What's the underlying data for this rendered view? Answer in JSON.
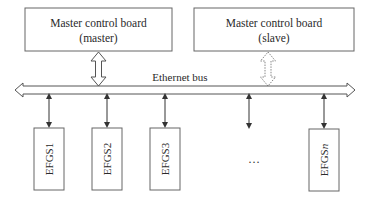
{
  "diagram": {
    "master_board": {
      "line1": "Master control board",
      "line2": "(master)"
    },
    "slave_board": {
      "line1": "Master control board",
      "line2": "(slave)"
    },
    "bus": {
      "label": "Ethernet bus"
    },
    "nodes": [
      {
        "label": "EFGS1"
      },
      {
        "label": "EFGS2"
      },
      {
        "label": "EFGS3"
      },
      {
        "label": "EFGS",
        "subscript_italic": "n"
      }
    ],
    "ellipsis": "…",
    "colors": {
      "stroke": "#555555",
      "dashed_stroke": "#888888",
      "background": "#ffffff"
    }
  }
}
